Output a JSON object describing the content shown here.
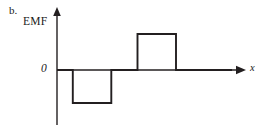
{
  "figure": {
    "panel_letter": "b.",
    "y_axis_title": "EMF",
    "x_axis_title": "x",
    "zero_label": "0",
    "background_color": "#ffffff",
    "stroke_color": "#231f20",
    "axis_color": "#231f20"
  },
  "chart_data": {
    "type": "line",
    "title": "EMF",
    "xlabel": "x",
    "ylabel": "EMF",
    "subtitle": "b.",
    "grid": false,
    "legend": null,
    "axis_style": "arrow-headed cartesian axes, y-axis vertical with upward arrow, x-axis horizontal with rightward arrow",
    "xlim": [
      0,
      10
    ],
    "ylim": [
      -2,
      2
    ],
    "ytick_labels": [
      "0"
    ],
    "ytick_values": [
      0
    ],
    "xtick_labels": [],
    "step_segments": [
      {
        "x_start": 0.0,
        "x_end": 0.9,
        "value": 0
      },
      {
        "x_start": 0.9,
        "x_end": 3.1,
        "value": -1.8
      },
      {
        "x_start": 3.1,
        "x_end": 4.6,
        "value": 0
      },
      {
        "x_start": 4.6,
        "x_end": 6.8,
        "value": 2.0
      },
      {
        "x_start": 6.8,
        "x_end": 10.0,
        "value": 0
      }
    ],
    "x": [
      0.0,
      0.9,
      0.9,
      3.1,
      3.1,
      4.6,
      4.6,
      6.8,
      6.8,
      10.0
    ],
    "values": [
      0,
      0,
      -1.8,
      -1.8,
      0,
      0,
      2.0,
      2.0,
      0,
      0
    ]
  },
  "geometry": {
    "width": 270,
    "height": 130,
    "origin_x": 57,
    "zero_y": 70,
    "y_axis_top": 8,
    "y_axis_bottom": 125,
    "x_axis_end": 245,
    "negative_pulse": {
      "x1": 73,
      "x2": 113,
      "y": 103
    },
    "positive_pulse": {
      "x1": 140,
      "x2": 179,
      "y": 34
    }
  }
}
